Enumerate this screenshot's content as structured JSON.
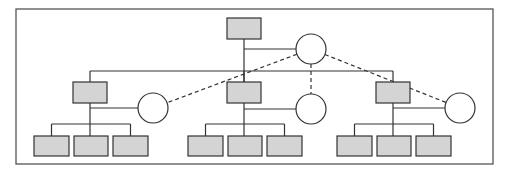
{
  "diagram": {
    "type": "hierarchy",
    "colors": {
      "box_fill": "#d4d4d4",
      "stroke": "#333333",
      "frame": "#555555",
      "circle_fill": "#ffffff"
    },
    "frame": {
      "x": 16,
      "y": 9,
      "w": 477,
      "h": 155
    },
    "root": {
      "box": {
        "x": 227,
        "y": 18,
        "w": 34,
        "h": 21
      },
      "circle": {
        "cx": 311,
        "cy": 49,
        "r": 15
      }
    },
    "branches": [
      {
        "box": {
          "x": 73,
          "y": 82,
          "w": 34,
          "h": 21
        },
        "circle": {
          "cx": 153,
          "cy": 108,
          "r": 15
        },
        "children": [
          {
            "x": 34,
            "y": 136,
            "w": 35,
            "h": 20
          },
          {
            "x": 74,
            "y": 136,
            "w": 34,
            "h": 20
          },
          {
            "x": 113,
            "y": 136,
            "w": 35,
            "h": 20
          }
        ]
      },
      {
        "box": {
          "x": 227,
          "y": 82,
          "w": 34,
          "h": 21
        },
        "circle": {
          "cx": 311,
          "cy": 109,
          "r": 15
        },
        "children": [
          {
            "x": 188,
            "y": 136,
            "w": 35,
            "h": 20
          },
          {
            "x": 228,
            "y": 136,
            "w": 34,
            "h": 20
          },
          {
            "x": 267,
            "y": 136,
            "w": 35,
            "h": 20
          }
        ]
      },
      {
        "box": {
          "x": 376,
          "y": 82,
          "w": 34,
          "h": 21
        },
        "circle": {
          "cx": 460,
          "cy": 108,
          "r": 15
        },
        "children": [
          {
            "x": 337,
            "y": 136,
            "w": 35,
            "h": 20
          },
          {
            "x": 377,
            "y": 136,
            "w": 34,
            "h": 20
          },
          {
            "x": 416,
            "y": 136,
            "w": 35,
            "h": 20
          }
        ]
      }
    ]
  }
}
